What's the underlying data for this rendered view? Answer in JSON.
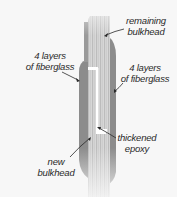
{
  "diagram": {
    "title": "",
    "colors": {
      "background": "#f7f7f7",
      "fiberglass": "#8a8a8a",
      "bulkhead_light": "#d8d8d8",
      "bulkhead_stripe": "#b9b9b9",
      "epoxy": "#ffffff",
      "text": "#2a2a2a"
    },
    "labels": {
      "remaining_bulkhead": {
        "line1": "remaining",
        "line2": "bulkhead"
      },
      "fiberglass_left": {
        "line1": "4 layers",
        "line2": "of fiberglass"
      },
      "fiberglass_right": {
        "line1": "4 layers",
        "line2": "of fiberglass"
      },
      "thickened_epoxy": {
        "line1": "thickened",
        "line2": "epoxy"
      },
      "new_bulkhead": {
        "line1": "new",
        "line2": "bulkhead"
      }
    },
    "parts": [
      "remaining bulkhead",
      "new bulkhead",
      "4 layers of fiberglass (left)",
      "4 layers of fiberglass (right)",
      "thickened epoxy"
    ]
  }
}
